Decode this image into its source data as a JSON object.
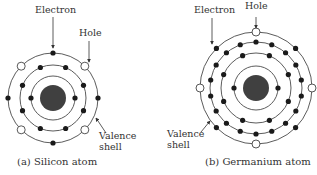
{
  "colors": {
    "ring": "#4a4a4a",
    "electron": "#1a1a1a",
    "nucleus": "#404040",
    "hole_fill": "#ffffff",
    "hole_stroke": "#444444",
    "text": "#333333"
  },
  "atoms": [
    {
      "id": "silicon",
      "caption": "(a) Silicon atom",
      "center": [
        53,
        98
      ],
      "nucleus_radius": 13,
      "labels": {
        "electron": "Electron",
        "hole": "Hole",
        "valence": "Valence",
        "shell": "shell"
      },
      "shells": [
        {
          "radius": 22,
          "electrons": 2,
          "offset_deg": 0,
          "holes": 0
        },
        {
          "radius": 33,
          "electrons": 8,
          "offset_deg": 22.5,
          "holes": 0
        },
        {
          "radius": 45,
          "electrons": 4,
          "offset_deg": 0,
          "holes": 4,
          "hole_offset_deg": 45
        }
      ]
    },
    {
      "id": "germanium",
      "caption": "(b) Germanium atom",
      "center": [
        256,
        88
      ],
      "nucleus_radius": 13,
      "labels": {
        "electron": "Electron",
        "hole": "Hole",
        "valence": "Valence",
        "shell": "shell"
      },
      "shells": [
        {
          "radius": 22,
          "electrons": 2,
          "offset_deg": 0,
          "holes": 0
        },
        {
          "radius": 35,
          "electrons": 8,
          "offset_deg": 22.5,
          "holes": 0
        },
        {
          "radius": 46,
          "electrons": 18,
          "offset_deg": 10,
          "holes": 0
        },
        {
          "radius": 56,
          "electrons": 4,
          "offset_deg": 45,
          "holes": 4,
          "hole_offset_deg": 0
        }
      ]
    }
  ]
}
